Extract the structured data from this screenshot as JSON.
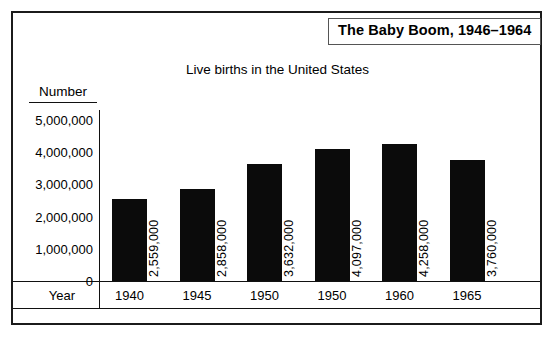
{
  "figure": {
    "title": "The Baby Boom, 1946–1964",
    "subtitle": "Live births in the United States",
    "y_axis_caption": "Number",
    "x_axis_caption": "Year"
  },
  "chart_data": {
    "type": "bar",
    "title": "The Baby Boom, 1946–1964",
    "subtitle": "Live births in the United States",
    "xlabel": "Year",
    "ylabel": "Number",
    "ylim": [
      0,
      5000000
    ],
    "ytick_labels": [
      "5,000,000",
      "4,000,000",
      "3,000,000",
      "2,000,000",
      "1,000,000",
      "0"
    ],
    "ytick_values": [
      5000000,
      4000000,
      3000000,
      2000000,
      1000000,
      0
    ],
    "grid": false,
    "legend": false,
    "bar_color": "#0b0b0b",
    "categories": [
      "1940",
      "1945",
      "1950",
      "1950",
      "1960",
      "1965"
    ],
    "values": [
      2559000,
      2858000,
      3632000,
      4097000,
      4258000,
      3760000
    ],
    "data_labels": [
      "2,559,000",
      "2,858,000",
      "3,632,000",
      "4,097,000",
      "4,258,000",
      "3,760,000"
    ],
    "bars": [
      {
        "category": "1940",
        "value": 2559000,
        "label": "2,559,000"
      },
      {
        "category": "1945",
        "value": 2858000,
        "label": "2,858,000"
      },
      {
        "category": "1950",
        "value": 3632000,
        "label": "3,632,000"
      },
      {
        "category": "1950",
        "value": 4097000,
        "label": "4,097,000"
      },
      {
        "category": "1960",
        "value": 4258000,
        "label": "4,258,000"
      },
      {
        "category": "1965",
        "value": 3760000,
        "label": "3,760,000"
      }
    ]
  }
}
